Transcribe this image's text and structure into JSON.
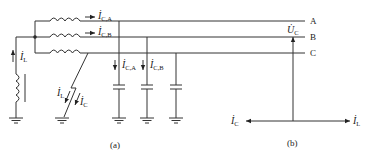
{
  "figure_a": {
    "caption": "(a)",
    "bus_labels": [
      "A",
      "B",
      "C"
    ],
    "inductor_current": {
      "main": "İ",
      "sub": "L"
    },
    "line_currents": [
      {
        "main": "İ",
        "sub": "C,A"
      },
      {
        "main": "İ",
        "sub": "C,B"
      }
    ],
    "capacitor_currents": [
      {
        "main": "İ",
        "sub": "C,A"
      },
      {
        "main": "İ",
        "sub": "C,B"
      }
    ],
    "fault_currents": [
      {
        "main": "İ",
        "sub": "L"
      },
      {
        "main": "İ",
        "sub": "C"
      }
    ]
  },
  "figure_b": {
    "caption": "(b)",
    "vertical_phasor": {
      "main": "U̇",
      "sub": "C"
    },
    "left_phasor": {
      "main": "İ",
      "sub": "C"
    },
    "right_phasor": {
      "main": "İ",
      "sub": "L"
    }
  }
}
